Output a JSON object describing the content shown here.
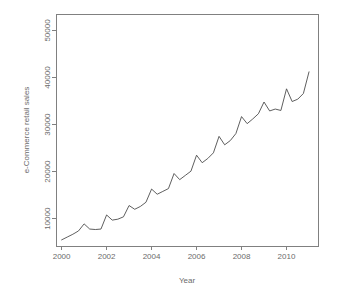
{
  "chart_data": {
    "type": "line",
    "title": "",
    "xlabel": "Year",
    "ylabel": "e-Commerce retail sales",
    "xlim": [
      1999.75,
      2011.4
    ],
    "ylim": [
      4200,
      53500
    ],
    "grid": false,
    "legend": null,
    "x_ticks": [
      2000,
      2002,
      2004,
      2006,
      2008,
      2010
    ],
    "x_tick_labels": [
      "2000",
      "2002",
      "2004",
      "2006",
      "2008",
      "2010"
    ],
    "y_ticks": [
      10000,
      20000,
      30000,
      40000,
      50000
    ],
    "y_tick_labels": [
      "10000",
      "20000",
      "30000",
      "40000",
      "50000"
    ],
    "series": [
      {
        "name": "e-Commerce retail sales",
        "color": "#4d4d4d",
        "x": [
          2000.0,
          2000.25,
          2000.5,
          2000.75,
          2001.0,
          2001.25,
          2001.5,
          2001.75,
          2002.0,
          2002.25,
          2002.5,
          2002.75,
          2003.0,
          2003.25,
          2003.5,
          2003.75,
          2004.0,
          2004.25,
          2004.5,
          2004.75,
          2005.0,
          2005.25,
          2005.5,
          2005.75,
          2006.0,
          2006.25,
          2006.5,
          2006.75,
          2007.0,
          2007.25,
          2007.5,
          2007.75,
          2008.0,
          2008.25,
          2008.5,
          2008.75,
          2009.0,
          2009.25,
          2009.5,
          2009.75,
          2010.0,
          2010.25,
          2010.5,
          2010.75,
          2011.0
        ],
        "values": [
          5500,
          6100,
          6700,
          7400,
          8900,
          7800,
          7700,
          7800,
          10800,
          9700,
          9900,
          10400,
          12800,
          12000,
          12600,
          13500,
          16300,
          15200,
          15800,
          16400,
          19600,
          18300,
          19200,
          20100,
          23500,
          21900,
          22800,
          24000,
          27500,
          25700,
          26600,
          28100,
          31700,
          30200,
          31200,
          32300,
          34800,
          32900,
          33300,
          33000,
          37600,
          34900,
          35400,
          36600,
          41200
        ],
        "values_note": "quarterly US e-Commerce retail sales, millions USD"
      }
    ],
    "peaks": [
      {
        "x": 2000.75,
        "y": 8900,
        "label": "2000 Q4"
      },
      {
        "x": 2001.75,
        "y": 10800,
        "label": "2001 Q4"
      },
      {
        "x": 2002.75,
        "y": 12800,
        "label": "2002 Q4"
      },
      {
        "x": 2003.75,
        "y": 16300,
        "label": "2003 Q4"
      },
      {
        "x": 2004.75,
        "y": 19600,
        "label": "2004 Q4"
      },
      {
        "x": 2005.75,
        "y": 23500,
        "label": "2005 Q4"
      },
      {
        "x": 2006.75,
        "y": 27500,
        "label": "2006 Q4"
      },
      {
        "x": 2007.75,
        "y": 31700,
        "label": "2007 Q4"
      },
      {
        "x": 2008.75,
        "y": 34800,
        "label": "2008 Q4"
      },
      {
        "x": 2009.75,
        "y": 37600,
        "label": "2009 Q4"
      },
      {
        "x": 2010.75,
        "y": 41200,
        "label": "2010 Q4"
      }
    ]
  }
}
